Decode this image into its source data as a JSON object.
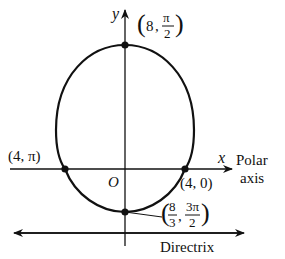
{
  "diagram": {
    "type": "polar-conic-ellipse",
    "axes": {
      "x_label": "x",
      "y_label": "y",
      "origin_label": "O",
      "polar_axis_label_line1": "Polar",
      "polar_axis_label_line2": "axis"
    },
    "directrix_label": "Directrix",
    "points": [
      {
        "id": "top",
        "r": "8",
        "theta_num": "π",
        "theta_den": "2"
      },
      {
        "id": "left",
        "label": "(4, π)"
      },
      {
        "id": "right",
        "label": "(4, 0)"
      },
      {
        "id": "bottom",
        "r_num": "8",
        "r_den": "3",
        "theta_num": "3π",
        "theta_den": "2"
      }
    ],
    "colors": {
      "stroke": "#111111",
      "background": "#ffffff"
    }
  }
}
